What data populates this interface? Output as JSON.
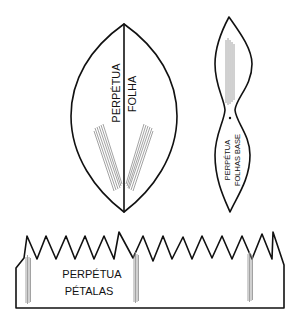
{
  "diagram": {
    "colors": {
      "stroke": "#111111",
      "stripe": "#8a8a8a",
      "background": "#ffffff"
    },
    "pieces": {
      "leaf": {
        "label_line1": "PERPÉTUA",
        "label_line2": "FOLHA"
      },
      "base_leaves": {
        "label_line1": "PERPÉTUA",
        "label_line2": "FOLHAS BASE"
      },
      "petals": {
        "label_line1": "PERPÉTUA",
        "label_line2": "PÉTALAS"
      }
    }
  }
}
